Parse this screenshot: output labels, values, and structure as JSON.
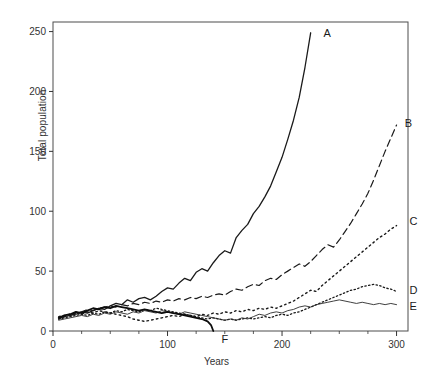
{
  "chart_data": {
    "type": "line",
    "title": "",
    "xlabel": "Years",
    "ylabel": "Total population",
    "xlim": [
      0,
      310
    ],
    "ylim": [
      0,
      258
    ],
    "xticks": [
      0,
      100,
      200,
      300
    ],
    "xticklabels": [
      "0",
      "100",
      "200",
      "300"
    ],
    "xminorticks": [
      25,
      50,
      75,
      125,
      150,
      175,
      225,
      250,
      275
    ],
    "yticks": [
      0,
      50,
      100,
      150,
      200,
      250
    ],
    "yticklabels": [
      "0",
      "50",
      "100",
      "150",
      "200",
      "250"
    ],
    "grid": false,
    "legend_position": "right-of-line-ends",
    "series": [
      {
        "name": "A",
        "label": "A",
        "style": "solid",
        "width": 1.3,
        "color": "#1a1a1a",
        "label_x": 231,
        "label_y": 249,
        "x": [
          5,
          10,
          15,
          20,
          25,
          30,
          35,
          40,
          45,
          50,
          55,
          60,
          65,
          70,
          75,
          80,
          85,
          90,
          95,
          100,
          105,
          110,
          115,
          120,
          125,
          130,
          135,
          140,
          145,
          150,
          155,
          160,
          165,
          170,
          175,
          180,
          185,
          190,
          195,
          200,
          205,
          210,
          215,
          220,
          225
        ],
        "y": [
          11,
          12,
          13,
          14,
          16,
          15,
          17,
          19,
          18,
          21,
          23,
          22,
          26,
          24,
          27,
          28,
          26,
          29,
          33,
          36,
          35,
          40,
          44,
          42,
          49,
          52,
          50,
          57,
          63,
          67,
          65,
          78,
          84,
          89,
          98,
          104,
          112,
          121,
          133,
          145,
          160,
          176,
          195,
          220,
          249
        ]
      },
      {
        "name": "B",
        "label": "B",
        "style": "dashed",
        "width": 1.2,
        "color": "#1a1a1a",
        "label_x": 302,
        "label_y": 174,
        "x": [
          5,
          10,
          15,
          20,
          25,
          30,
          35,
          40,
          45,
          50,
          55,
          60,
          65,
          70,
          75,
          80,
          85,
          90,
          95,
          100,
          105,
          110,
          115,
          120,
          125,
          130,
          135,
          140,
          145,
          150,
          155,
          160,
          165,
          170,
          175,
          180,
          185,
          190,
          195,
          200,
          205,
          210,
          215,
          220,
          225,
          230,
          235,
          240,
          245,
          250,
          255,
          260,
          265,
          270,
          275,
          280,
          285,
          290,
          295,
          300
        ],
        "y": [
          10,
          12,
          13,
          15,
          16,
          18,
          17,
          19,
          20,
          21,
          20,
          22,
          21,
          23,
          22,
          24,
          23,
          25,
          24,
          26,
          25,
          27,
          26,
          28,
          27,
          29,
          28,
          30,
          31,
          30,
          33,
          35,
          34,
          37,
          39,
          38,
          42,
          44,
          43,
          47,
          50,
          53,
          56,
          54,
          58,
          63,
          68,
          72,
          70,
          76,
          83,
          90,
          98,
          106,
          115,
          126,
          138,
          150,
          161,
          172
        ]
      },
      {
        "name": "C",
        "label": "C",
        "style": "dotted",
        "width": 1.4,
        "color": "#1a1a1a",
        "label_x": 306,
        "label_y": 92,
        "x": [
          5,
          10,
          15,
          20,
          25,
          30,
          35,
          40,
          45,
          50,
          55,
          60,
          65,
          70,
          75,
          80,
          85,
          90,
          95,
          100,
          105,
          110,
          115,
          120,
          125,
          130,
          135,
          140,
          145,
          150,
          155,
          160,
          165,
          170,
          175,
          180,
          185,
          190,
          195,
          200,
          205,
          210,
          215,
          220,
          225,
          230,
          235,
          240,
          245,
          250,
          255,
          260,
          265,
          270,
          275,
          280,
          285,
          290,
          295,
          300
        ],
        "y": [
          12,
          13,
          14,
          15,
          14,
          16,
          15,
          17,
          16,
          15,
          14,
          13,
          12,
          10,
          9,
          8,
          9,
          10,
          11,
          12,
          13,
          12,
          14,
          13,
          12,
          14,
          13,
          15,
          14,
          16,
          15,
          17,
          16,
          18,
          17,
          19,
          18,
          20,
          19,
          21,
          23,
          25,
          28,
          31,
          34,
          33,
          38,
          42,
          46,
          50,
          54,
          58,
          62,
          66,
          70,
          74,
          78,
          81,
          85,
          88
        ]
      },
      {
        "name": "D",
        "label": "D",
        "style": "dotted",
        "width": 1.3,
        "color": "#1a1a1a",
        "label_x": 306,
        "label_y": 34,
        "x": [
          5,
          10,
          15,
          20,
          25,
          30,
          35,
          40,
          45,
          50,
          55,
          60,
          65,
          70,
          75,
          80,
          85,
          90,
          95,
          100,
          105,
          110,
          115,
          120,
          125,
          130,
          135,
          140,
          145,
          150,
          155,
          160,
          165,
          170,
          175,
          180,
          185,
          190,
          195,
          200,
          205,
          210,
          215,
          220,
          225,
          230,
          235,
          240,
          245,
          250,
          255,
          260,
          265,
          270,
          275,
          280,
          285,
          290,
          295,
          300
        ],
        "y": [
          10,
          11,
          12,
          13,
          14,
          13,
          15,
          14,
          16,
          15,
          17,
          16,
          18,
          17,
          16,
          18,
          17,
          19,
          18,
          17,
          16,
          15,
          14,
          13,
          12,
          11,
          10,
          11,
          10,
          9,
          10,
          9,
          10,
          11,
          10,
          11,
          12,
          11,
          13,
          14,
          13,
          15,
          16,
          18,
          20,
          22,
          24,
          26,
          28,
          30,
          32,
          34,
          35,
          37,
          38,
          39,
          38,
          36,
          35,
          33
        ]
      },
      {
        "name": "E",
        "label": "E",
        "style": "solid",
        "width": 0.9,
        "color": "#2a2a2a",
        "label_x": 306,
        "label_y": 21,
        "x": [
          5,
          10,
          15,
          20,
          25,
          30,
          35,
          40,
          45,
          50,
          55,
          60,
          65,
          70,
          75,
          80,
          85,
          90,
          95,
          100,
          105,
          110,
          115,
          120,
          125,
          130,
          135,
          140,
          145,
          150,
          155,
          160,
          165,
          170,
          175,
          180,
          185,
          190,
          195,
          200,
          205,
          210,
          215,
          220,
          225,
          230,
          235,
          240,
          245,
          250,
          255,
          260,
          265,
          270,
          275,
          280,
          285,
          290,
          295,
          300
        ],
        "y": [
          9,
          10,
          11,
          12,
          13,
          12,
          14,
          13,
          15,
          14,
          16,
          15,
          14,
          16,
          15,
          17,
          16,
          15,
          17,
          16,
          15,
          14,
          16,
          15,
          14,
          13,
          12,
          11,
          10,
          9,
          10,
          9,
          11,
          10,
          12,
          14,
          13,
          15,
          16,
          15,
          17,
          18,
          20,
          21,
          20,
          22,
          23,
          24,
          25,
          26,
          25,
          24,
          23,
          24,
          23,
          22,
          23,
          22,
          23,
          22
        ]
      },
      {
        "name": "F",
        "label": "F",
        "style": "solid",
        "width": 1.8,
        "color": "#0d0d0d",
        "label_x": 142,
        "label_y": -7,
        "x": [
          5,
          10,
          15,
          20,
          25,
          30,
          35,
          40,
          45,
          50,
          55,
          60,
          65,
          70,
          75,
          80,
          85,
          90,
          95,
          100,
          105,
          110,
          115,
          120,
          125,
          130,
          135,
          138,
          140
        ],
        "y": [
          11,
          13,
          14,
          16,
          15,
          17,
          19,
          18,
          20,
          19,
          21,
          20,
          19,
          18,
          17,
          18,
          17,
          16,
          15,
          16,
          15,
          14,
          13,
          12,
          11,
          10,
          8,
          5,
          0
        ]
      }
    ]
  }
}
